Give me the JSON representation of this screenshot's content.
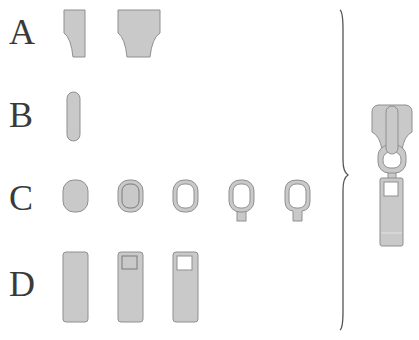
{
  "diagram": {
    "rows": [
      {
        "label": "A",
        "part": "slider-body",
        "count": 2
      },
      {
        "label": "B",
        "part": "slider-bridge",
        "count": 1
      },
      {
        "label": "C",
        "part": "ring-link",
        "count": 5
      },
      {
        "label": "D",
        "part": "pull-tab",
        "count": 3
      }
    ],
    "assembled": {
      "part": "assembled-zipper-pull"
    },
    "colors": {
      "fill": "#c9c9c9",
      "stroke": "#8f8f8f",
      "label": "#3a3a3a",
      "brace": "#555555",
      "background": "#ffffff"
    }
  }
}
